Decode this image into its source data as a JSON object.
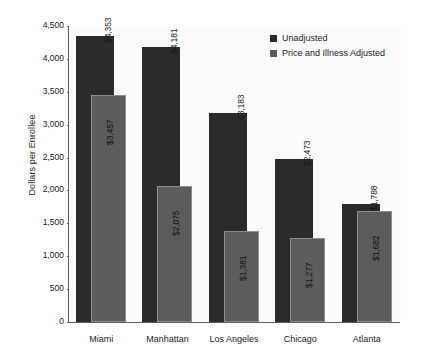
{
  "chart_data": {
    "type": "bar",
    "title": "",
    "xlabel": "",
    "ylabel": "Dollars per Enrollee",
    "ylim": [
      0,
      4500
    ],
    "ytick_values": [
      0,
      500,
      1000,
      1500,
      2000,
      2500,
      3000,
      3500,
      4000,
      4500
    ],
    "ytick_labels": [
      "0",
      "500",
      "1,000",
      "1,500",
      "2,000",
      "2,500",
      "3,000",
      "3,500",
      "4,000",
      "4,500"
    ],
    "grid": false,
    "legend_position": "top-right",
    "categories": [
      "Miami",
      "Manhattan",
      "Los Angeles",
      "Chicago",
      "Atlanta"
    ],
    "series": [
      {
        "name": "Unadjusted",
        "color": "#2b2b2b",
        "values": [
          4353,
          4181,
          3183,
          2473,
          1788
        ],
        "labels": [
          "$4,353",
          "$4,181",
          "$3,183",
          "$2,473",
          "$1,788"
        ]
      },
      {
        "name": "Price and Illness Adjusted",
        "color": "#5c5c5c",
        "values": [
          3457,
          2075,
          1381,
          1277,
          1682
        ],
        "labels": [
          "$3,457",
          "$2,075",
          "$1,381",
          "$1,277",
          "$1,682"
        ]
      }
    ]
  },
  "legend": {
    "items": [
      {
        "label": "Unadjusted",
        "swatch": "dark"
      },
      {
        "label": "Price and Illness Adjusted",
        "swatch": "gray"
      }
    ]
  }
}
